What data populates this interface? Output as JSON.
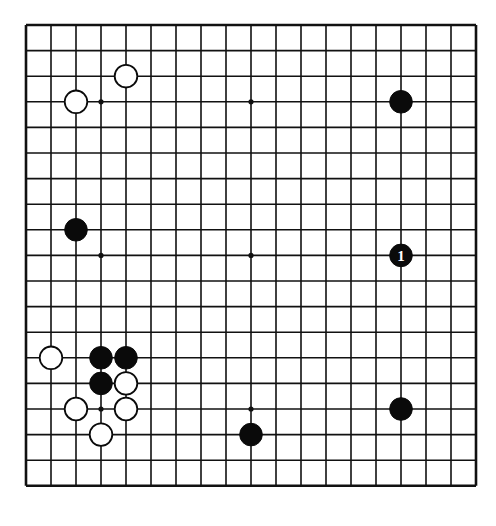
{
  "board": {
    "size": 19,
    "origin_x": 26,
    "origin_y": 25,
    "spacing_x": 25.0,
    "spacing_y": 25.6,
    "line_color": "#111111",
    "background": "#ffffff",
    "star_points": [
      [
        3,
        3
      ],
      [
        9,
        3
      ],
      [
        15,
        3
      ],
      [
        3,
        9
      ],
      [
        9,
        9
      ],
      [
        15,
        9
      ],
      [
        3,
        15
      ],
      [
        9,
        15
      ],
      [
        15,
        15
      ]
    ],
    "stones": [
      {
        "color": "white",
        "col": 4,
        "row": 2
      },
      {
        "color": "white",
        "col": 2,
        "row": 3
      },
      {
        "color": "black",
        "col": 15,
        "row": 3
      },
      {
        "color": "black",
        "col": 2,
        "row": 8
      },
      {
        "color": "black",
        "col": 15,
        "row": 9,
        "label": "1"
      },
      {
        "color": "white",
        "col": 1,
        "row": 13
      },
      {
        "color": "black",
        "col": 3,
        "row": 13
      },
      {
        "color": "black",
        "col": 4,
        "row": 13
      },
      {
        "color": "black",
        "col": 3,
        "row": 14
      },
      {
        "color": "white",
        "col": 4,
        "row": 14
      },
      {
        "color": "white",
        "col": 2,
        "row": 15
      },
      {
        "color": "white",
        "col": 4,
        "row": 15
      },
      {
        "color": "black",
        "col": 15,
        "row": 15
      },
      {
        "color": "white",
        "col": 3,
        "row": 16
      },
      {
        "color": "black",
        "col": 9,
        "row": 16
      }
    ]
  }
}
